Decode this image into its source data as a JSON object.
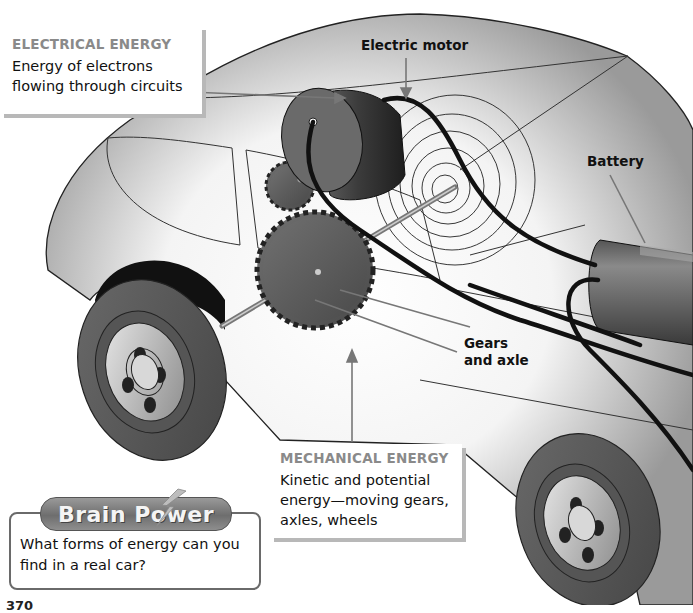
{
  "electrical_callout": {
    "title": "ELECTRICAL ENERGY",
    "body_line1": "Energy of electrons",
    "body_line2": "flowing through circuits"
  },
  "mechanical_callout": {
    "title": "MECHANICAL ENERGY",
    "body_line1": "Kinetic and potential",
    "body_line2": "energy—moving gears,",
    "body_line3": "axles, wheels"
  },
  "labels": {
    "motor": "Electric motor",
    "battery": "Battery",
    "gears_line1": "Gears",
    "gears_line2": "and axle"
  },
  "brain_power": {
    "title": "Brain Power",
    "question_line1": "What forms of energy can you",
    "question_line2": "find in a real car?"
  },
  "page_number": "370",
  "colors": {
    "callout_title": "#8a8a8a",
    "car_body": "#9e9e9e",
    "tire": "#5a5a5a",
    "motor": "#3a3a3a",
    "badge": "#7a7a7a"
  },
  "icons": {
    "brain_power_bolt": "lightning-bolt-icon"
  }
}
